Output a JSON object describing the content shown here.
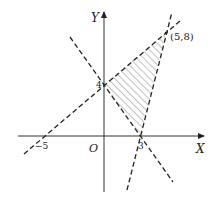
{
  "figure": {
    "type": "linear-programming-feasible-region",
    "axes": {
      "x_label": "X",
      "y_label": "Y",
      "origin_label": "O"
    },
    "tick_labels": {
      "x_neg5": "−5",
      "x_3": "3",
      "y_4": "4"
    },
    "point_label": "(5,8)",
    "lines": [
      {
        "name": "line-through-neg5-0-and-5-8",
        "equation": "y = 0.8x + 4",
        "style": "dashed"
      },
      {
        "name": "line-through-0-4-and-3-0",
        "equation": "y = -4/3x + 4",
        "style": "dashed"
      },
      {
        "name": "line-through-3-0-and-5-8",
        "equation": "y = 4x - 12",
        "style": "dashed"
      }
    ],
    "shaded_region": {
      "vertices": [
        [
          0,
          4
        ],
        [
          5,
          8
        ],
        [
          3,
          0
        ]
      ],
      "fill": "hatched"
    },
    "colors": {
      "line": "#222222",
      "axis": "#333333",
      "hatch": "#555555"
    }
  }
}
